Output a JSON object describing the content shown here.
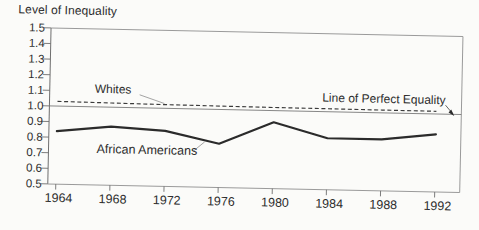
{
  "figure": {
    "title": "Level of Inequality",
    "background": "#fbfbf9",
    "text_color": "#2d2d2d",
    "axis_color": "#9a9a9a",
    "tick_color": "#6f6f6f",
    "line_color": "#2b2b2b",
    "leader_color": "#9a9a9a"
  },
  "chart_data": {
    "type": "line",
    "title": "Level of Inequality",
    "xlabel": "",
    "ylabel": "Level of Inequality",
    "x": [
      1964,
      1968,
      1972,
      1976,
      1980,
      1984,
      1988,
      1992
    ],
    "x_tick_labels": [
      "1964",
      "1968",
      "1972",
      "1976",
      "1980",
      "1984",
      "1988",
      "1992"
    ],
    "ylim": [
      0.5,
      1.5
    ],
    "y_ticks": [
      1.5,
      1.4,
      1.3,
      1.2,
      1.1,
      1.0,
      0.9,
      0.8,
      0.7,
      0.6,
      0.5
    ],
    "y_tick_labels": [
      "1.5",
      "1.4",
      "1.3",
      "1.2",
      "1.1",
      "1.0",
      "0.9",
      "0.8",
      "0.7",
      "0.6",
      "0.5"
    ],
    "grid": false,
    "legend_position": "inline-annotations",
    "series": [
      {
        "name": "Whites",
        "line_style": "dashed",
        "values": [
          1.03,
          1.027,
          1.024,
          1.022,
          1.02,
          1.019,
          1.018,
          1.017
        ]
      },
      {
        "name": "African Americans",
        "line_style": "solid-thick",
        "values": [
          0.84,
          0.875,
          0.855,
          0.78,
          0.925,
          0.83,
          0.83,
          0.87
        ]
      },
      {
        "name": "Line of Perfect Equality",
        "line_style": "solid-thin-reference",
        "values": [
          1.0,
          1.0,
          1.0,
          1.0,
          1.0,
          1.0,
          1.0,
          1.0
        ]
      }
    ]
  }
}
